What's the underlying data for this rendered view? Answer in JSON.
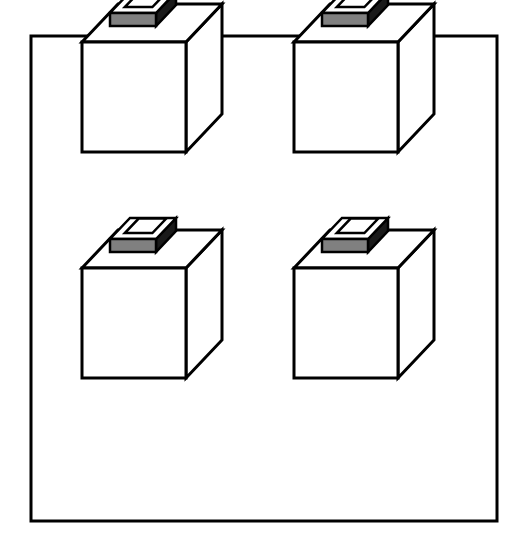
{
  "figure": {
    "caption": "Four identical cube-shaped containers, each with a rectangular raised handle on its top face, arranged in a two-by-two grid inside a rectangular border frame.",
    "background_color": "#ffffff",
    "line_color": "#000000",
    "scan_band_color": "#1c1c1c"
  },
  "frame": {
    "name": "outer-border",
    "x": 31,
    "y": 36,
    "width": 466,
    "height": 485,
    "stroke_width": 3,
    "stroke_color": "#000000",
    "fill_color": "#ffffff"
  },
  "layout": {
    "rows": 2,
    "columns": 2,
    "count": 4,
    "column_x": [
      82,
      294
    ],
    "row_y": [
      104,
      330
    ]
  },
  "cube_geometry": {
    "front_width": 104,
    "front_height": 110,
    "depth_dx": 36,
    "depth_dy": -38,
    "stroke_width": 3,
    "stroke_color": "#000000",
    "front_face_color": "#ffffff",
    "top_face_color": "#ffffff",
    "side_face_color": "#ffffff"
  },
  "handle_geometry": {
    "offset_x": 28,
    "offset_y": -16,
    "width": 46,
    "depth_dx": 20,
    "depth_dy": -21,
    "rise": 13,
    "wall": 8,
    "top_face_color": "#ffffff",
    "front_face_color": "#808080",
    "right_face_color": "#1a1a1a",
    "stroke_width": 2.5,
    "stroke_color": "#000000"
  },
  "cubes": [
    {
      "id": "cube-top-left",
      "label": "Cube 1",
      "row": 0,
      "column": 0,
      "origin_x": 82,
      "origin_y": 152
    },
    {
      "id": "cube-top-right",
      "label": "Cube 2",
      "row": 0,
      "column": 1,
      "origin_x": 294,
      "origin_y": 152
    },
    {
      "id": "cube-bottom-left",
      "label": "Cube 3",
      "row": 1,
      "column": 0,
      "origin_x": 82,
      "origin_y": 378
    },
    {
      "id": "cube-bottom-right",
      "label": "Cube 4",
      "row": 1,
      "column": 1,
      "origin_x": 294,
      "origin_y": 378
    }
  ]
}
